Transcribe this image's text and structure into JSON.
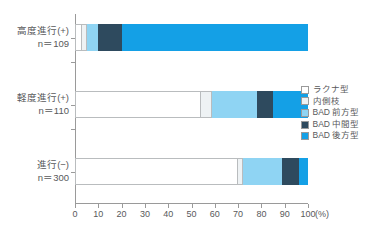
{
  "chart_data": {
    "type": "bar",
    "orientation": "horizontal",
    "stacked": true,
    "percent": true,
    "title": "",
    "xlabel": "(%)",
    "ylabel": "",
    "xlim": [
      0,
      100
    ],
    "xticks": [
      0,
      10,
      20,
      30,
      40,
      50,
      60,
      70,
      80,
      90,
      100
    ],
    "xticklabels": [
      "0",
      "10",
      "20",
      "30",
      "40",
      "50",
      "60",
      "70",
      "80",
      "90",
      "100"
    ],
    "x_unit": "(%)",
    "grid": false,
    "legend_position": "right",
    "categories": [
      {
        "label": "高度進行(+)",
        "n_label": "n＝109",
        "n": 109
      },
      {
        "label": "軽度進行(+)",
        "n_label": "n＝110",
        "n": 110
      },
      {
        "label": "進行(−)",
        "n_label": "n＝300",
        "n": 300
      }
    ],
    "series": [
      {
        "name": "ラクナ型",
        "color": "#ffffff",
        "values": [
          3,
          54,
          70
        ]
      },
      {
        "name": "内側枝",
        "color": "#eef2f4",
        "values": [
          2,
          5,
          2
        ]
      },
      {
        "name": "BAD 前方型",
        "color": "#8fd4f3",
        "values": [
          5,
          19,
          17
        ]
      },
      {
        "name": "BAD 中間型",
        "color": "#2e4a5e",
        "values": [
          10,
          7,
          7
        ]
      },
      {
        "name": "BAD 後方型",
        "color": "#14a0e6",
        "values": [
          80,
          15,
          4
        ]
      }
    ]
  },
  "legend": {
    "items": [
      {
        "label": "ラクナ型",
        "color": "#ffffff"
      },
      {
        "label": "内側枝",
        "color": "#eef2f4"
      },
      {
        "label": "BAD 前方型",
        "color": "#8fd4f3"
      },
      {
        "label": "BAD 中間型",
        "color": "#2e4a5e"
      },
      {
        "label": "BAD 後方型",
        "color": "#14a0e6"
      }
    ]
  },
  "axis": {
    "line_color": "#9a9a9a",
    "text_color": "#58595b"
  }
}
